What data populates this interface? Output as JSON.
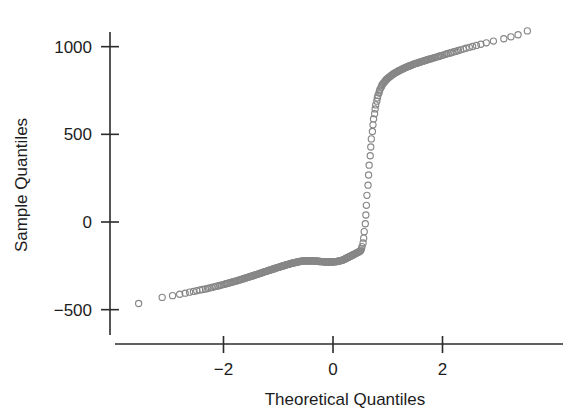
{
  "figure": {
    "background_color": "#ffffff",
    "axis_color": "#2b2b2b",
    "marker_color": "#878787"
  },
  "labels": {
    "x_axis_title": "Theoretical Quantiles",
    "y_axis_title": "Sample Quantiles",
    "x_tick_labels": [
      "-2",
      "0",
      "2"
    ],
    "y_tick_labels": [
      "-500",
      "0",
      "500",
      "1000"
    ]
  },
  "chart_data": {
    "type": "scatter",
    "title": "",
    "xlabel": "Theoretical Quantiles",
    "ylabel": "Sample Quantiles",
    "xlim": [
      -3.9,
      4.1
    ],
    "ylim": [
      -560,
      1160
    ],
    "xticks": [
      -2,
      0,
      2
    ],
    "yticks": [
      -500,
      0,
      500,
      1000
    ],
    "grid": false,
    "legend": "none",
    "marker": "open-circle",
    "marker_color": "#878787",
    "series": [
      {
        "name": "Normal Q-Q",
        "x": [
          -3.55,
          -3.12,
          -2.93,
          -2.8,
          -2.7,
          -2.62,
          -2.55,
          -2.49,
          -2.43,
          -2.38,
          -2.33,
          -2.29,
          -2.25,
          -2.21,
          -2.17,
          -2.14,
          -2.1,
          -2.07,
          -2.04,
          -2.01,
          -1.98,
          -1.95,
          -1.93,
          -1.9,
          -1.87,
          -1.85,
          -1.82,
          -1.8,
          -1.78,
          -1.75,
          -1.73,
          -1.71,
          -1.69,
          -1.67,
          -1.65,
          -1.63,
          -1.61,
          -1.59,
          -1.57,
          -1.55,
          -1.53,
          -1.51,
          -1.49,
          -1.47,
          -1.46,
          -1.44,
          -1.42,
          -1.4,
          -1.39,
          -1.37,
          -1.35,
          -1.34,
          -1.32,
          -1.3,
          -1.29,
          -1.27,
          -1.26,
          -1.24,
          -1.22,
          -1.21,
          -1.19,
          -1.18,
          -1.16,
          -1.15,
          -1.13,
          -1.12,
          -1.1,
          -1.09,
          -1.07,
          -1.06,
          -1.05,
          -1.03,
          -1.02,
          -1.0,
          -0.99,
          -0.97,
          -0.96,
          -0.95,
          -0.93,
          -0.92,
          -0.9,
          -0.89,
          -0.88,
          -0.86,
          -0.85,
          -0.84,
          -0.82,
          -0.81,
          -0.8,
          -0.78,
          -0.77,
          -0.76,
          -0.74,
          -0.73,
          -0.72,
          -0.7,
          -0.69,
          -0.68,
          -0.66,
          -0.65,
          -0.64,
          -0.62,
          -0.61,
          -0.6,
          -0.59,
          -0.57,
          -0.56,
          -0.55,
          -0.53,
          -0.52,
          -0.51,
          -0.5,
          -0.48,
          -0.47,
          -0.46,
          -0.44,
          -0.43,
          -0.42,
          -0.41,
          -0.39,
          -0.38,
          -0.37,
          -0.36,
          -0.34,
          -0.33,
          -0.32,
          -0.31,
          -0.29,
          -0.28,
          -0.27,
          -0.26,
          -0.24,
          -0.23,
          -0.22,
          -0.21,
          -0.19,
          -0.18,
          -0.17,
          -0.16,
          -0.14,
          -0.13,
          -0.12,
          -0.11,
          -0.09,
          -0.08,
          -0.07,
          -0.06,
          -0.04,
          -0.03,
          -0.02,
          -0.01,
          0.01,
          0.02,
          0.03,
          0.04,
          0.06,
          0.07,
          0.08,
          0.09,
          0.11,
          0.12,
          0.13,
          0.14,
          0.16,
          0.17,
          0.18,
          0.19,
          0.21,
          0.22,
          0.23,
          0.24,
          0.26,
          0.27,
          0.28,
          0.29,
          0.31,
          0.32,
          0.33,
          0.34,
          0.36,
          0.37,
          0.38,
          0.39,
          0.41,
          0.42,
          0.43,
          0.44,
          0.46,
          0.47,
          0.48,
          0.5,
          0.51,
          0.52,
          0.53,
          0.55,
          0.56,
          0.57,
          0.59,
          0.6,
          0.61,
          0.62,
          0.64,
          0.65,
          0.66,
          0.68,
          0.69,
          0.7,
          0.72,
          0.73,
          0.74,
          0.76,
          0.77,
          0.78,
          0.8,
          0.81,
          0.82,
          0.84,
          0.85,
          0.86,
          0.88,
          0.89,
          0.9,
          0.92,
          0.93,
          0.95,
          0.96,
          0.97,
          0.99,
          1.0,
          1.02,
          1.03,
          1.05,
          1.06,
          1.07,
          1.09,
          1.1,
          1.12,
          1.13,
          1.15,
          1.16,
          1.18,
          1.19,
          1.21,
          1.22,
          1.24,
          1.26,
          1.27,
          1.29,
          1.3,
          1.32,
          1.34,
          1.35,
          1.37,
          1.39,
          1.4,
          1.42,
          1.44,
          1.46,
          1.47,
          1.49,
          1.51,
          1.53,
          1.55,
          1.57,
          1.59,
          1.61,
          1.63,
          1.65,
          1.67,
          1.69,
          1.71,
          1.73,
          1.75,
          1.78,
          1.8,
          1.82,
          1.85,
          1.87,
          1.9,
          1.93,
          1.95,
          1.98,
          2.01,
          2.04,
          2.07,
          2.1,
          2.14,
          2.17,
          2.21,
          2.25,
          2.29,
          2.33,
          2.38,
          2.43,
          2.49,
          2.55,
          2.62,
          2.7,
          2.8,
          2.93,
          3.12,
          3.25,
          3.38,
          3.55
        ],
        "y": [
          -465,
          -430,
          -420,
          -412,
          -406,
          -400,
          -396,
          -392,
          -388,
          -385,
          -382,
          -379,
          -376,
          -373,
          -370,
          -367,
          -365,
          -362,
          -360,
          -357,
          -355,
          -352,
          -350,
          -348,
          -345,
          -343,
          -341,
          -339,
          -337,
          -335,
          -333,
          -331,
          -329,
          -327,
          -325,
          -323,
          -321,
          -319,
          -317,
          -315,
          -313,
          -311,
          -309,
          -308,
          -306,
          -304,
          -302,
          -300,
          -299,
          -297,
          -295,
          -293,
          -292,
          -290,
          -288,
          -287,
          -285,
          -283,
          -282,
          -280,
          -278,
          -277,
          -275,
          -274,
          -272,
          -271,
          -269,
          -268,
          -266,
          -265,
          -263,
          -262,
          -260,
          -259,
          -257,
          -256,
          -255,
          -253,
          -252,
          -251,
          -249,
          -248,
          -247,
          -245,
          -244,
          -243,
          -242,
          -241,
          -240,
          -238,
          -237,
          -236,
          -235,
          -234,
          -233,
          -232,
          -231,
          -230,
          -229,
          -228,
          -227,
          -226,
          -226,
          -225,
          -224,
          -224,
          -223,
          -223,
          -222,
          -222,
          -222,
          -222,
          -221,
          -221,
          -221,
          -221,
          -221,
          -221,
          -221,
          -221,
          -222,
          -222,
          -222,
          -222,
          -223,
          -223,
          -223,
          -224,
          -224,
          -224,
          -225,
          -225,
          -225,
          -226,
          -226,
          -226,
          -227,
          -227,
          -227,
          -227,
          -228,
          -228,
          -228,
          -228,
          -228,
          -228,
          -228,
          -228,
          -228,
          -228,
          -228,
          -227,
          -227,
          -227,
          -226,
          -226,
          -225,
          -225,
          -224,
          -223,
          -222,
          -221,
          -220,
          -219,
          -218,
          -216,
          -215,
          -213,
          -211,
          -209,
          -207,
          -205,
          -203,
          -201,
          -199,
          -197,
          -195,
          -193,
          -191,
          -189,
          -187,
          -185,
          -183,
          -181,
          -179,
          -177,
          -175,
          -173,
          -171,
          -168,
          -165,
          -160,
          -152,
          -140,
          -120,
          -92,
          -55,
          -10,
          40,
          95,
          152,
          210,
          268,
          324,
          378,
          428,
          474,
          516,
          554,
          588,
          618,
          645,
          668,
          689,
          707,
          722,
          736,
          748,
          758,
          768,
          776,
          784,
          790,
          796,
          802,
          807,
          812,
          816,
          820,
          824,
          828,
          831,
          835,
          838,
          841,
          844,
          847,
          850,
          853,
          855,
          858,
          861,
          863,
          866,
          868,
          871,
          873,
          876,
          878,
          880,
          883,
          885,
          887,
          889,
          891,
          893,
          896,
          898,
          900,
          902,
          904,
          906,
          908,
          910,
          912,
          914,
          916,
          918,
          920,
          922,
          924,
          926,
          928,
          930,
          932,
          935,
          937,
          939,
          942,
          944,
          947,
          949,
          952,
          955,
          958,
          961,
          964,
          967,
          971,
          974,
          978,
          982,
          986,
          991,
          996,
          1001,
          1007,
          1014,
          1022,
          1032,
          1045,
          1056,
          1068,
          1090
        ]
      }
    ]
  }
}
